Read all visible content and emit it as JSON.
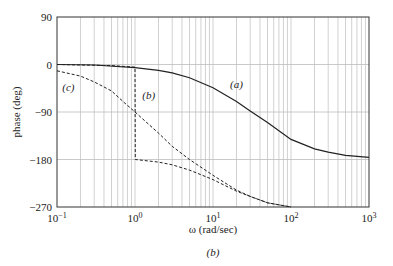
{
  "chart_data": {
    "type": "line",
    "title": "",
    "caption": "(b)",
    "xlabel": "ω (rad/sec)",
    "ylabel": "phase (deg)",
    "xscale": "log",
    "xlim": [
      0.1,
      1000
    ],
    "ylim": [
      -270,
      90
    ],
    "xticks": [
      0.1,
      1,
      10,
      100,
      1000
    ],
    "xtick_labels": [
      "10−1",
      "100",
      "101",
      "102",
      "103"
    ],
    "yticks": [
      90,
      0,
      -90,
      -180,
      -270
    ],
    "ytick_labels": [
      "90",
      "0",
      "−90",
      "−180",
      "−270"
    ],
    "grid": true,
    "series": [
      {
        "name": "(a)",
        "style": "solid",
        "x": [
          0.1,
          0.3,
          1,
          2,
          3,
          5,
          10,
          20,
          30,
          50,
          100,
          200,
          300,
          500,
          1000
        ],
        "y": [
          0,
          -1,
          -6,
          -11,
          -16,
          -25,
          -44,
          -70,
          -88,
          -110,
          -142,
          -160,
          -166,
          -172,
          -176
        ]
      },
      {
        "name": "(b)",
        "style": "dashed",
        "x": [
          0.1,
          0.5,
          0.99,
          1.0,
          1.01,
          2,
          3,
          5,
          10,
          20,
          30,
          50,
          100
        ],
        "y": [
          0,
          -2,
          -5,
          -5,
          -180,
          -185,
          -190,
          -200,
          -218,
          -240,
          -250,
          -262,
          -270
        ]
      },
      {
        "name": "(c)",
        "style": "dashed",
        "x": [
          0.1,
          0.2,
          0.3,
          0.5,
          0.7,
          1,
          2,
          3,
          5,
          10,
          20,
          30,
          50,
          100
        ],
        "y": [
          -12,
          -22,
          -33,
          -50,
          -70,
          -90,
          -130,
          -155,
          -180,
          -210,
          -238,
          -250,
          -262,
          -270
        ]
      }
    ],
    "annotations": [
      {
        "text": "(a)",
        "x": 20,
        "y": -45
      },
      {
        "text": "(b)",
        "x": 1.5,
        "y": -65
      },
      {
        "text": "(c)",
        "x": 0.14,
        "y": -50
      }
    ]
  }
}
